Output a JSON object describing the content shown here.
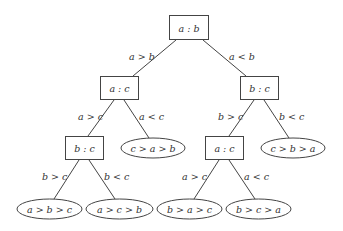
{
  "diagram": {
    "type": "decision-tree",
    "nodes": {
      "root": {
        "label": "a : b"
      },
      "l": {
        "label": "a : c"
      },
      "r": {
        "label": "b : c"
      },
      "ll": {
        "label": "b : c"
      },
      "lr": {
        "label": "c > a > b"
      },
      "rl": {
        "label": "a : c"
      },
      "rr": {
        "label": "c > b > a"
      },
      "lll": {
        "label": "a > b > c"
      },
      "llr": {
        "label": "a > c > b"
      },
      "rll": {
        "label": "b > a > c"
      },
      "rlr": {
        "label": "b > c > a"
      }
    },
    "edges": {
      "root_l": "a > b",
      "root_r": "a < b",
      "l_ll": "a > c",
      "l_lr": "a < c",
      "r_rl": "b > c",
      "r_rr": "b < c",
      "ll_lll": "b > c",
      "ll_llr": "b < c",
      "rl_rll": "a > c",
      "rl_rlr": "a < c"
    }
  }
}
